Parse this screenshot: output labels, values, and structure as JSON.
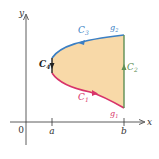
{
  "diagram": {
    "colors": {
      "fill": "#f8d9a8",
      "c1": "#d8336a",
      "c2": "#5e8f55",
      "c3": "#3b7fc4",
      "c4": "#222222",
      "axis": "#333333",
      "label_dark": "#222222"
    },
    "axes": {
      "x_label": "x",
      "y_label": "y",
      "origin_label": "0",
      "ticks": [
        {
          "label": "a"
        },
        {
          "label": "b"
        }
      ]
    },
    "curves": [
      {
        "id": "C1",
        "name": "C",
        "sub": "1",
        "color_key": "c1",
        "description": "lower boundary y = g1(x), traversed left to right"
      },
      {
        "id": "C2",
        "name": "C",
        "sub": "2",
        "color_key": "c2",
        "description": "right vertical segment x = b, traversed upward"
      },
      {
        "id": "C3",
        "name": "C",
        "sub": "3",
        "color_key": "c3",
        "description": "upper boundary y = g2(x), traversed right to left"
      },
      {
        "id": "C4",
        "name": "C",
        "sub": "4",
        "color_key": "c4",
        "description": "left vertical segment x = a, traversed downward"
      }
    ],
    "function_labels": [
      {
        "name": "g",
        "sub": "1"
      },
      {
        "name": "g",
        "sub": "2"
      }
    ]
  }
}
